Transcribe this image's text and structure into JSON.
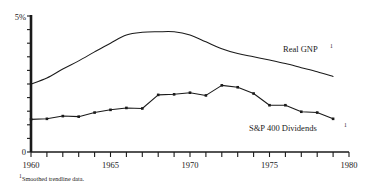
{
  "chart_data": {
    "type": "line",
    "title": "",
    "subtitle": "",
    "xlabel": "",
    "ylabel": "",
    "xlim": [
      1960,
      1980
    ],
    "ylim": [
      0,
      5
    ],
    "grid": false,
    "legend_position": "inline-right",
    "y_axis": {
      "top_label": "5%",
      "bottom_label": "0",
      "ticks": [
        0,
        0.5,
        1,
        1.5,
        2,
        2.5,
        3,
        3.5,
        4,
        4.5,
        5
      ]
    },
    "x_axis": {
      "tick_labels": [
        "1960",
        "1965",
        "1970",
        "1975",
        "1980"
      ],
      "tick_years": [
        1960,
        1961,
        1962,
        1963,
        1964,
        1965,
        1966,
        1967,
        1968,
        1969,
        1970,
        1971,
        1972,
        1973,
        1974,
        1975,
        1976,
        1977,
        1978,
        1979,
        1980
      ],
      "labeled_years": [
        1960,
        1965,
        1970,
        1975,
        1980
      ]
    },
    "x": [
      1960,
      1961,
      1962,
      1963,
      1964,
      1965,
      1966,
      1967,
      1968,
      1969,
      1970,
      1971,
      1972,
      1973,
      1974,
      1975,
      1976,
      1977,
      1978,
      1979
    ],
    "series": [
      {
        "name": "Real GNP",
        "label": "Real GNP",
        "footnote_marker": "1",
        "markers": false,
        "color": "#1a1a1a",
        "values": [
          2.5,
          2.72,
          3.05,
          3.35,
          3.68,
          4.0,
          4.3,
          4.4,
          4.42,
          4.42,
          4.3,
          4.05,
          3.8,
          3.62,
          3.5,
          3.38,
          3.25,
          3.1,
          2.95,
          2.78
        ]
      },
      {
        "name": "S&P 400 Dividends",
        "label": "S&P 400 Dividends",
        "footnote_marker": "1",
        "markers": true,
        "color": "#1a1a1a",
        "values": [
          1.2,
          1.22,
          1.32,
          1.3,
          1.45,
          1.55,
          1.62,
          1.6,
          2.1,
          2.12,
          2.18,
          2.08,
          2.45,
          2.38,
          2.15,
          1.72,
          1.72,
          1.48,
          1.45,
          1.22
        ]
      }
    ],
    "annotations": [
      {
        "id": "real-gnp-label",
        "text": "Real GNP",
        "sup": "1"
      },
      {
        "id": "sp400-label",
        "text": "S&P 400 Dividends",
        "sup": "1"
      }
    ]
  },
  "footnote": {
    "marker": "1",
    "text": "Smoothed trendline data."
  },
  "colors": {
    "ink": "#1a1a1a",
    "axis": "#1a1a1a",
    "background": "#ffffff"
  }
}
